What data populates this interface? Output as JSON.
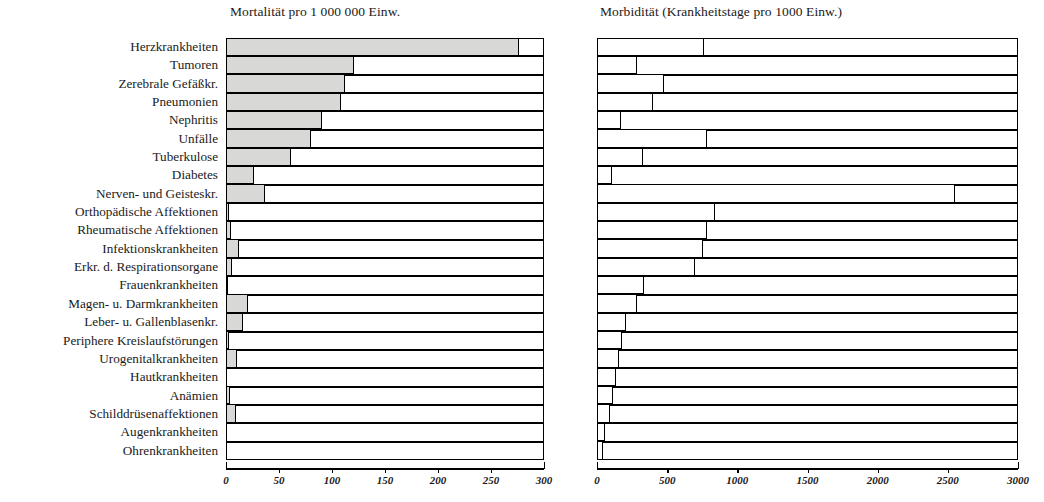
{
  "header": {
    "left_title": "Mortalität pro 1 000 000 Einw.",
    "right_title": "Morbidität (Krankheitstage pro 1000 Einw.)"
  },
  "chart_data": {
    "type": "bar",
    "orientation": "horizontal",
    "grid": false,
    "legend": "none",
    "panels": [
      {
        "name": "mortality",
        "title": "Mortalität pro 1 000 000 Einw.",
        "xlabel": "",
        "ylabel": "",
        "xlim": [
          0,
          300
        ],
        "xticks": [
          0,
          50,
          100,
          150,
          200,
          250,
          300
        ],
        "xticklabels": [
          "0",
          "50",
          "100",
          "150",
          "200",
          "250",
          "300"
        ],
        "bar_fill": "#d8d8d6",
        "bar_edge": "#000000"
      },
      {
        "name": "morbidity",
        "title": "Morbidität (Krankheitstage pro 1000 Einw.)",
        "xlabel": "",
        "ylabel": "",
        "xlim": [
          0,
          3000
        ],
        "xticks": [
          0,
          500,
          1000,
          1500,
          2000,
          2500,
          3000
        ],
        "xticklabels": [
          "0",
          "500",
          "1000",
          "1500",
          "2000",
          "2500",
          "3000"
        ],
        "bar_fill": "#ffffff",
        "bar_edge": "#000000"
      }
    ],
    "categories": [
      "Herzkrankheiten",
      "Tumoren",
      "Zerebrale Gefäßkr.",
      "Pneumonien",
      "Nephritis",
      "Unfälle",
      "Tuberkulose",
      "Diabetes",
      "Nerven- und Geisteskr.",
      "Orthopädische Affektionen",
      "Rheumatische Affektionen",
      "Infektionskrankheiten",
      "Erkr. d. Respirationsorgane",
      "Frauenkrankheiten",
      "Magen- u. Darmkrankheiten",
      "Leber- u. Gallenblasenkr.",
      "Periphere Kreislaufstörungen",
      "Urogenitalkrankheiten",
      "Hautkrankheiten",
      "Anämien",
      "Schilddrüsenaffektionen",
      "Augenkrankheiten",
      "Ohrenkrankheiten"
    ],
    "series": [
      {
        "name": "Mortalität pro 1 000 000 Einw.",
        "panel": "mortality",
        "values": [
          277,
          121,
          113,
          109,
          91,
          81,
          62,
          27,
          37,
          3,
          5,
          13,
          6,
          2,
          21,
          16,
          3,
          11,
          0,
          4,
          10,
          0,
          0
        ]
      },
      {
        "name": "Morbidität (Krankheitstage pro 1000 Einw.)",
        "panel": "morbidity",
        "values": [
          765,
          290,
          480,
          400,
          175,
          790,
          330,
          110,
          2557,
          845,
          790,
          760,
          700,
          340,
          290,
          210,
          180,
          160,
          140,
          115,
          95,
          60,
          45
        ]
      }
    ]
  }
}
